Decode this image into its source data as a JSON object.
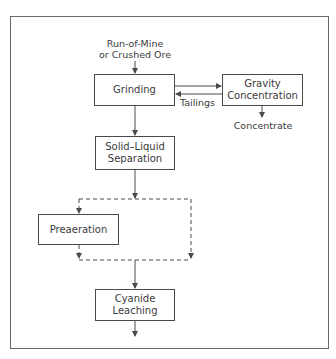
{
  "diagram": {
    "input_label": "Run-of-Mine\nor Crushed Ore",
    "nodes": {
      "grinding": "Grinding",
      "gravity": "Gravity\nConcentration",
      "solid_liquid": "Solid–Liquid\nSeparation",
      "preaeration": "Preaeration",
      "cyanide": "Cyanide\nLeaching"
    },
    "edge_labels": {
      "tailings": "Tailings",
      "concentrate": "Concentrate"
    },
    "colors": {
      "line": "#4a4a4a",
      "frame": "#6a6a6a",
      "text": "#3a3a3a"
    }
  }
}
